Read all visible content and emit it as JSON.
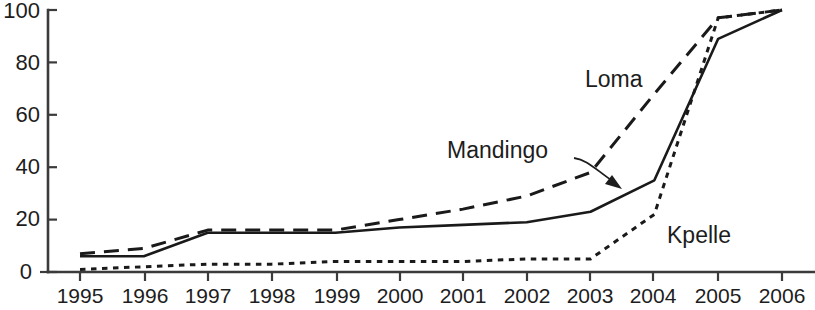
{
  "chart_data": {
    "type": "line",
    "title": "",
    "subtitle": "",
    "xlabel": "",
    "ylabel": "",
    "categories": [
      "1995",
      "1996",
      "1997",
      "1998",
      "1999",
      "2000",
      "2001",
      "2002",
      "2003",
      "2004",
      "2005",
      "2006"
    ],
    "x": [
      1995,
      1996,
      1997,
      1998,
      1999,
      2000,
      2001,
      2002,
      2003,
      2004,
      2005,
      2006
    ],
    "xlim": [
      1995,
      2006
    ],
    "ylim": [
      0,
      100
    ],
    "ytick_labels": [
      "0",
      "20",
      "40",
      "60",
      "80",
      "100"
    ],
    "yticks": [
      0,
      20,
      40,
      60,
      80,
      100
    ],
    "xtick_labels": [
      "1995",
      "1996",
      "1997",
      "1998",
      "1999",
      "2000",
      "2001",
      "2002",
      "2003",
      "2004",
      "2005",
      "2006"
    ],
    "grid": false,
    "legend_position": "inline-annotations",
    "series": [
      {
        "name": "Mandingo",
        "style": "solid",
        "color": "#1a1a1a",
        "values": [
          6,
          6,
          15,
          15,
          15,
          17,
          18,
          19,
          23,
          35,
          89,
          100
        ]
      },
      {
        "name": "Loma",
        "style": "dashed",
        "color": "#1a1a1a",
        "values": [
          7,
          9,
          16,
          16,
          16,
          20,
          24,
          29,
          38,
          68,
          97,
          100
        ]
      },
      {
        "name": "Kpelle",
        "style": "dotted",
        "color": "#1a1a1a",
        "values": [
          1,
          2,
          3,
          3,
          4,
          4,
          4,
          5,
          5,
          22,
          97,
          100
        ]
      }
    ],
    "annotations": [
      {
        "text": "Loma",
        "kind": "inline-label",
        "anchor_series": "Loma"
      },
      {
        "text": "Mandingo",
        "kind": "leader-label-arrow",
        "anchor_series": "Mandingo"
      },
      {
        "text": "Kpelle",
        "kind": "inline-label",
        "anchor_series": "Kpelle"
      }
    ]
  },
  "labels": {
    "loma": "Loma",
    "mandingo": "Mandingo",
    "kpelle": "Kpelle"
  },
  "colors": {
    "ink": "#1a1a1a",
    "axis": "#3b3b3b",
    "background": "#ffffff"
  }
}
